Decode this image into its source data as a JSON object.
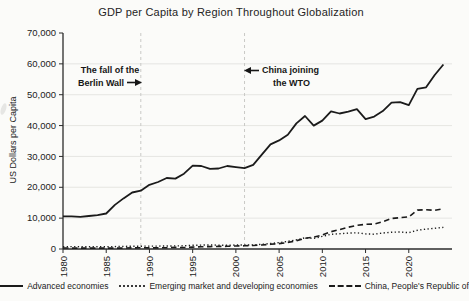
{
  "annotations": [
    {
      "line1": "The fall of the",
      "line2": "Berlin Wall",
      "arrow": "right",
      "points_to_year": 1989
    },
    {
      "line1": "China joining",
      "line2": "the WTO",
      "arrow": "left",
      "points_to_year": 2001
    }
  ],
  "y_axis": {
    "label": "US Dollars per Capita",
    "ticks": [
      "70,000",
      "60,000",
      "50,000",
      "40,000",
      "30,000",
      "20,000",
      "10,000",
      "0"
    ]
  },
  "x_axis": {
    "ticks": [
      "1980",
      "1985",
      "1990",
      "1995",
      "2000",
      "2005",
      "2010",
      "2015",
      "2020"
    ]
  },
  "colors": {
    "line": "#1b1b1b",
    "grid": "#e3e3e0",
    "vline": "#c9c9c6",
    "axis": "#2b2b2b",
    "text": "#222222"
  },
  "chart_data": {
    "type": "line",
    "title": "GDP per Capita by Region Throughout Globalization",
    "xlabel": "",
    "ylabel": "US Dollars per Capita",
    "xlim": [
      1980,
      2025
    ],
    "ylim": [
      0,
      70000
    ],
    "grid": "horizontal",
    "legend_position": "bottom",
    "vlines": [
      1989,
      2001
    ],
    "x": [
      1980,
      1981,
      1982,
      1983,
      1984,
      1985,
      1986,
      1987,
      1988,
      1989,
      1990,
      1991,
      1992,
      1993,
      1994,
      1995,
      1996,
      1997,
      1998,
      1999,
      2000,
      2001,
      2002,
      2003,
      2004,
      2005,
      2006,
      2007,
      2008,
      2009,
      2010,
      2011,
      2012,
      2013,
      2014,
      2015,
      2016,
      2017,
      2018,
      2019,
      2020,
      2021,
      2022,
      2023,
      2024
    ],
    "series": [
      {
        "name": "Advanced economies",
        "style": "solid",
        "values": [
          10600,
          10600,
          10400,
          10700,
          11000,
          11500,
          14300,
          16400,
          18300,
          18900,
          20800,
          21700,
          23000,
          22800,
          24400,
          27000,
          26900,
          26000,
          26100,
          26900,
          26500,
          26200,
          27300,
          30600,
          33900,
          35200,
          37000,
          40700,
          43100,
          40000,
          41600,
          44600,
          43900,
          44500,
          45300,
          42100,
          42900,
          44700,
          47400,
          47600,
          46600,
          51900,
          52400,
          56400,
          59800
        ]
      },
      {
        "name": "Emerging market and developing economies",
        "style": "dotted",
        "values": [
          750,
          780,
          750,
          720,
          720,
          740,
          780,
          830,
          900,
          920,
          950,
          950,
          960,
          1000,
          1030,
          1200,
          1280,
          1320,
          1240,
          1210,
          1300,
          1290,
          1330,
          1510,
          1770,
          2080,
          2450,
          2950,
          3620,
          3430,
          4080,
          4750,
          4970,
          5150,
          5250,
          4880,
          4800,
          5180,
          5430,
          5500,
          5280,
          6050,
          6450,
          6700,
          7000
        ]
      },
      {
        "name": "China, People's Republic of",
        "style": "dashed",
        "values": [
          310,
          290,
          280,
          300,
          300,
          290,
          280,
          300,
          370,
          410,
          350,
          360,
          420,
          520,
          470,
          610,
          710,
          780,
          830,
          870,
          960,
          1050,
          1150,
          1290,
          1510,
          1750,
          2100,
          2690,
          3470,
          3830,
          4550,
          5620,
          6300,
          7050,
          7640,
          8020,
          8090,
          8820,
          9900,
          10140,
          10410,
          12620,
          12720,
          12510,
          13040
        ]
      }
    ]
  }
}
